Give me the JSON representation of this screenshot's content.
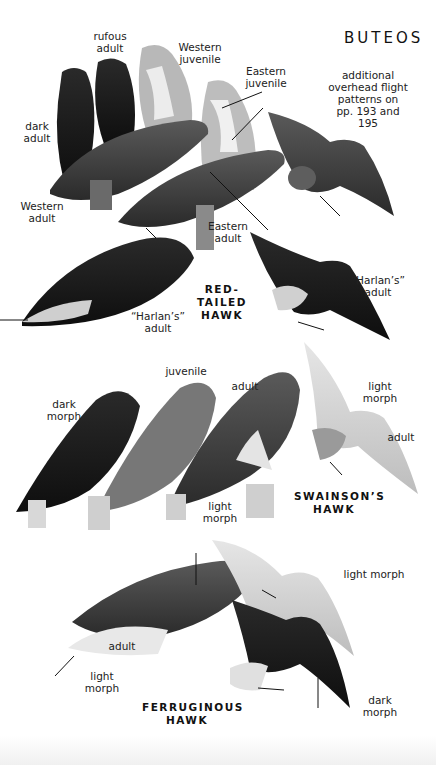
{
  "page_title": "BUTEOS",
  "note": "additional\noverhead flight\npatterns on\npp. 193 and 195",
  "species": [
    {
      "name": "RED-TAILED\nHAWK",
      "labels": [
        {
          "id": "rufous-adult",
          "text": "rufous\nadult"
        },
        {
          "id": "western-juvenile",
          "text": "Western\njuvenile"
        },
        {
          "id": "eastern-juvenile",
          "text": "Eastern\njuvenile"
        },
        {
          "id": "dark-adult",
          "text": "dark\nadult"
        },
        {
          "id": "western-adult",
          "text": "Western\nadult"
        },
        {
          "id": "eastern-adult",
          "text": "Eastern\nadult"
        },
        {
          "id": "harlans-adult-perched",
          "text": "“Harlan’s”\nadult"
        },
        {
          "id": "harlans-adult-flight",
          "text": "“Harlan’s”\nadult"
        }
      ]
    },
    {
      "name": "SWAINSON’S\nHAWK",
      "labels": [
        {
          "id": "dark-morph",
          "text": "dark\nmorph"
        },
        {
          "id": "juvenile",
          "text": "juvenile"
        },
        {
          "id": "adult-perched",
          "text": "adult"
        },
        {
          "id": "light-morph-perched",
          "text": "light\nmorph"
        },
        {
          "id": "light-morph-flight",
          "text": "light\nmorph"
        },
        {
          "id": "adult-flight",
          "text": "adult"
        }
      ]
    },
    {
      "name": "FERRUGINOUS\nHAWK",
      "labels": [
        {
          "id": "adult",
          "text": "adult"
        },
        {
          "id": "light-morph-perched",
          "text": "light\nmorph"
        },
        {
          "id": "light-morph-flight",
          "text": "light morph"
        },
        {
          "id": "dark-morph-flight",
          "text": "dark\nmorph"
        }
      ]
    }
  ],
  "colors": {
    "ink": "#111111",
    "dark_bird": "#1c1c1c",
    "mid_bird": "#4a4a4a",
    "light_bird": "#d8d8d8",
    "background": "#ffffff"
  }
}
